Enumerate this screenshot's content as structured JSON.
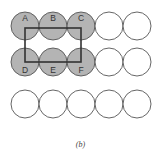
{
  "diagram": {
    "rows": 3,
    "cols": 5,
    "circle_radius": 14,
    "col_centers_x": [
      25,
      53,
      81,
      109,
      137
    ],
    "row_centers_y": [
      26,
      62,
      104
    ],
    "shaded_fill": "#b4b4b4",
    "empty_fill": "#ffffff",
    "stroke": "#555555",
    "label_color": "#333333",
    "labeled_circles": [
      {
        "label": "A",
        "row": 0,
        "col": 0,
        "shaded": true,
        "label_pos": "top"
      },
      {
        "label": "B",
        "row": 0,
        "col": 1,
        "shaded": true,
        "label_pos": "top"
      },
      {
        "label": "C",
        "row": 0,
        "col": 2,
        "shaded": true,
        "label_pos": "top"
      },
      {
        "label": "D",
        "row": 1,
        "col": 0,
        "shaded": true,
        "label_pos": "bottom"
      },
      {
        "label": "E",
        "row": 1,
        "col": 1,
        "shaded": true,
        "label_pos": "bottom"
      },
      {
        "label": "F",
        "row": 1,
        "col": 2,
        "shaded": true,
        "label_pos": "bottom"
      }
    ],
    "rectangle": {
      "x1": 25,
      "y1": 28,
      "x2": 81,
      "y2": 62,
      "stroke": "#333333",
      "stroke_width": 1.6
    }
  },
  "caption": "(b)"
}
